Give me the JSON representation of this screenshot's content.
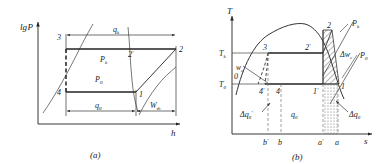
{
  "figure": {
    "panels": [
      {
        "id": "a",
        "caption": "(a)",
        "axis": {
          "y_label": "lg P",
          "x_label": "h"
        },
        "points": [
          "3",
          "2'",
          "2",
          "4",
          "1"
        ],
        "region_labels": [
          "P k",
          "P 0"
        ],
        "dimension_labels": [
          "q k",
          "q 0",
          "W th"
        ],
        "labels": {
          "y_axis": "lg",
          "y_axis_var": "P",
          "x_axis": "h",
          "p3": "3",
          "p2prime": "2",
          "p2prime_prime": "′",
          "p2": "2",
          "p4": "4",
          "p1": "1",
          "pk_main": "P",
          "pk_sub": "k",
          "p0_main": "P",
          "p0_sub": "0",
          "qk_main": "q",
          "qk_sub": "k",
          "q0_main": "q",
          "q0_sub": "0",
          "w_main": "W",
          "w_sub": "th"
        }
      },
      {
        "id": "b",
        "caption": "(b)",
        "axis": {
          "y_label": "T",
          "x_label": "s"
        },
        "points": [
          "3",
          "2'",
          "2",
          "4'",
          "4",
          "1'",
          "1",
          "0"
        ],
        "tick_labels_y": [
          "T k",
          "T 0"
        ],
        "tick_labels_x": [
          "b'",
          "b",
          "a'",
          "a"
        ],
        "labels": {
          "y_axis": "T",
          "x_axis": "s",
          "Tk_main": "T",
          "Tk_sub": "k",
          "T0_main": "T",
          "T0_sub": "0",
          "p3": "3",
          "p2prime": "2",
          "p2prime_prime": "′",
          "p2": "2",
          "p4prime": "4",
          "p4prime_prime": "′",
          "p4": "4",
          "p1prime": "1",
          "p1prime_prime": "′",
          "p1": "1",
          "p0": "0",
          "pk_main": "P",
          "pk_sub": "k",
          "p0line_main": "P",
          "p0line_sub": "0",
          "dwk_main": "Δw",
          "dwk_sub": "c",
          "w0_main": "w",
          "w0_sub": "c",
          "dq0p_main": "Δq",
          "dq0p_sub": "0",
          "dq0p_prime": "′",
          "q0_main": "q",
          "q0_sub": "0",
          "dq0_main": "Δq",
          "dq0_sub": "0",
          "tick_bp": "b",
          "tick_bp_prime": "′",
          "tick_b": "b",
          "tick_ap": "a",
          "tick_ap_prime": "′",
          "tick_a": "a"
        }
      }
    ]
  },
  "colors": {
    "ink": "#1a1a1a",
    "line": "#222222",
    "thin": "#555555",
    "hatch": "#333333",
    "dot": "#777777"
  }
}
